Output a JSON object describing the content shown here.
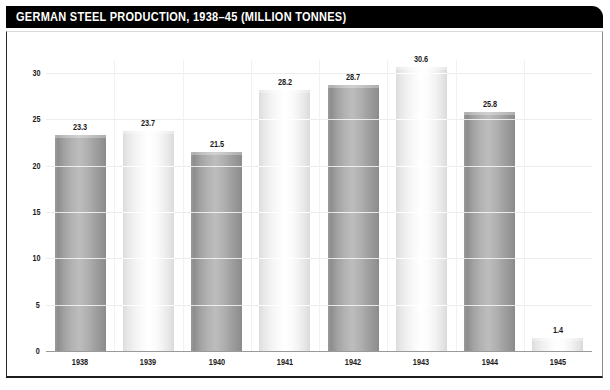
{
  "title": "GERMAN STEEL PRODUCTION, 1938–45 (MILLION TONNES)",
  "colors": {
    "banner_background": "#000000",
    "banner_text": "#ffffff",
    "page_background": "#ffffff",
    "panel_border": "#1c1c1c",
    "bar_dark": "#aaaaaa",
    "bar_light": "#f5f5f5",
    "gridline": "#ededed",
    "axis_text": "#1a1a1a"
  },
  "chart_data": {
    "type": "bar",
    "title": "GERMAN STEEL PRODUCTION, 1938–45 (MILLION TONNES)",
    "xlabel": "",
    "ylabel": "",
    "categories": [
      "1938",
      "1939",
      "1940",
      "1941",
      "1942",
      "1943",
      "1944",
      "1945"
    ],
    "values": [
      23.3,
      23.7,
      21.5,
      28.2,
      28.7,
      30.6,
      25.8,
      1.4
    ],
    "value_labels": [
      "23.3",
      "23.7",
      "21.5",
      "28.2",
      "28.7",
      "30.6",
      "25.8",
      "1.4"
    ],
    "bar_styles": [
      "dark",
      "light",
      "dark",
      "light",
      "dark",
      "light",
      "dark",
      "light"
    ],
    "ylim": [
      0,
      32.4
    ],
    "yticks": [
      0,
      5,
      10,
      15,
      20,
      25,
      30
    ],
    "ytick_labels": [
      "0",
      "5",
      "10",
      "15",
      "20",
      "25",
      "30"
    ],
    "grid": true,
    "legend": false,
    "units": "million tonnes"
  }
}
